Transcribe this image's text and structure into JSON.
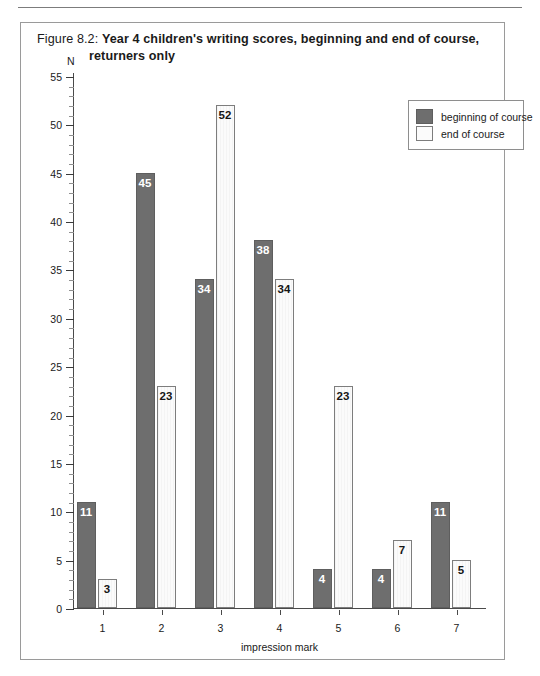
{
  "figure": {
    "label": "Figure 8.2:",
    "title_line1": "Year 4 children's writing scores, beginning and end of course,",
    "title_line2": "returners only"
  },
  "legend": {
    "position": "top-right",
    "entries": [
      {
        "label": "beginning of course",
        "swatch": "dark-gray-square",
        "color": "#6e6e6e"
      },
      {
        "label": "end of course",
        "swatch": "white-square",
        "color": "#fbfbfb"
      }
    ]
  },
  "axes": {
    "y_unit": "N",
    "y_ticks": [
      "0",
      "5",
      "10",
      "15",
      "20",
      "25",
      "30",
      "35",
      "40",
      "45",
      "50",
      "55"
    ],
    "x_title": "impression mark",
    "x_ticks": [
      "1",
      "2",
      "3",
      "4",
      "5",
      "6",
      "7"
    ]
  },
  "chart_data": {
    "type": "bar",
    "title": "Figure 8.2: Year 4 children's writing scores, beginning and end of course, returners only",
    "subtitle": "",
    "xlabel": "impression mark",
    "ylabel": "N",
    "ylim": [
      0,
      55
    ],
    "ytick_step_major": 5,
    "ytick_step_minor": 1,
    "grid": false,
    "legend_position": "top-right",
    "categories": [
      "1",
      "2",
      "3",
      "4",
      "5",
      "6",
      "7"
    ],
    "series": [
      {
        "name": "beginning of course",
        "color": "#6e6e6e",
        "values": [
          11,
          45,
          34,
          38,
          4,
          4,
          11
        ]
      },
      {
        "name": "end of course",
        "color": "#fbfbfb",
        "values": [
          3,
          23,
          52,
          34,
          23,
          7,
          5
        ]
      }
    ],
    "data_labels": true
  }
}
